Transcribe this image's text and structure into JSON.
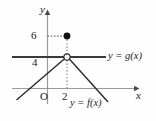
{
  "figure": {
    "background": "#fefefe",
    "ink": "#1a1a1a",
    "grid_color": "#9a9a9a",
    "width": 156,
    "height": 121
  },
  "axes": {
    "y_label": "y",
    "x_label": "x",
    "origin_label": "O",
    "y_ticks": [
      {
        "value": "6",
        "pixel_y": 36
      },
      {
        "value": "4",
        "pixel_y": 57
      }
    ],
    "x_ticks": [
      {
        "value": "2",
        "pixel_x": 67
      }
    ],
    "x_axis_pixel_y": 88,
    "y_axis_pixel_x": 47,
    "x_axis_from": 12,
    "x_axis_to": 138,
    "y_axis_from": 103,
    "y_axis_to": 10
  },
  "curves": [
    {
      "name": "g",
      "label": "y = g(x)",
      "type": "horizontal-line",
      "y_value": 4,
      "pixel_y": 57,
      "pixel_x_start": 12,
      "pixel_x_end": 106,
      "stroke_width": 1.9
    },
    {
      "name": "f",
      "label": "y = f(x)",
      "type": "inverted-v",
      "vertex": {
        "x": 2,
        "y": 4
      },
      "pixel_vertex": {
        "x": 67,
        "y": 57
      },
      "pixel_left_end": {
        "x": 17,
        "y": 99
      },
      "pixel_right_end": {
        "x": 107,
        "y": 101
      },
      "stroke_width": 1.2
    }
  ],
  "markers": [
    {
      "name": "open-circle-at-vertex",
      "style": "open",
      "point": {
        "x": 2,
        "y": 4
      },
      "pixel": {
        "x": 67,
        "y": 57
      },
      "radius": 3.1
    },
    {
      "name": "filled-dot-at-six",
      "style": "filled",
      "point": {
        "x": 2,
        "y": 6
      },
      "pixel": {
        "x": 67,
        "y": 36
      },
      "radius": 3.3
    }
  ],
  "guides": [
    {
      "name": "dotted-horizontal-to-six",
      "from_pixel": {
        "x": 47,
        "y": 36
      },
      "to_pixel": {
        "x": 65,
        "y": 36
      },
      "dash": "1.6 1.6"
    },
    {
      "name": "dotted-vertical-at-two",
      "from_pixel": {
        "x": 67,
        "y": 39
      },
      "to_pixel": {
        "x": 67,
        "y": 90
      },
      "dash": "1.6 1.8"
    }
  ]
}
